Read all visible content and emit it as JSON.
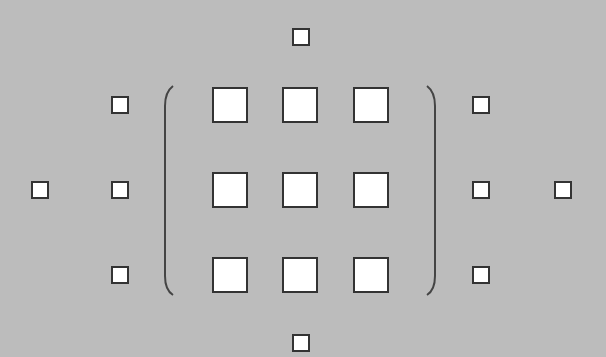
{
  "diagram": {
    "colors": {
      "background": "#bcbcbc",
      "square_fill": "#ffffff",
      "square_border": "#333333",
      "parenthesis": "#444444"
    },
    "matrix": {
      "rows": 3,
      "cols": 3,
      "cells": [
        {
          "row": 0,
          "col": 0,
          "x": 212,
          "y": 87
        },
        {
          "row": 0,
          "col": 1,
          "x": 282,
          "y": 87
        },
        {
          "row": 0,
          "col": 2,
          "x": 353,
          "y": 87
        },
        {
          "row": 1,
          "col": 0,
          "x": 212,
          "y": 172
        },
        {
          "row": 1,
          "col": 1,
          "x": 282,
          "y": 172
        },
        {
          "row": 1,
          "col": 2,
          "x": 353,
          "y": 172
        },
        {
          "row": 2,
          "col": 0,
          "x": 212,
          "y": 257
        },
        {
          "row": 2,
          "col": 1,
          "x": 282,
          "y": 257
        },
        {
          "row": 2,
          "col": 2,
          "x": 353,
          "y": 257
        }
      ]
    },
    "small_squares": [
      {
        "position": "top",
        "x": 292,
        "y": 28
      },
      {
        "position": "bottom",
        "x": 292,
        "y": 334
      },
      {
        "position": "left-top",
        "x": 111,
        "y": 96
      },
      {
        "position": "left-middle",
        "x": 111,
        "y": 181
      },
      {
        "position": "left-bottom",
        "x": 111,
        "y": 266
      },
      {
        "position": "far-left",
        "x": 31,
        "y": 181
      },
      {
        "position": "right-top",
        "x": 472,
        "y": 96
      },
      {
        "position": "right-middle",
        "x": 472,
        "y": 181
      },
      {
        "position": "right-bottom",
        "x": 472,
        "y": 266
      },
      {
        "position": "far-right",
        "x": 554,
        "y": 181
      }
    ]
  }
}
